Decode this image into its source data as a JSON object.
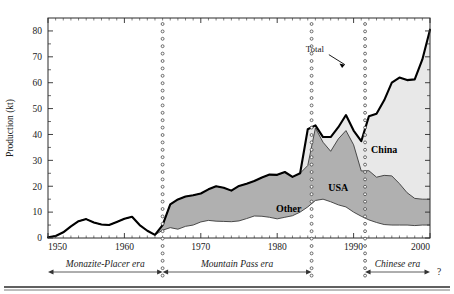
{
  "figure": {
    "y_axis_title": "Production (kt)",
    "bottom_rule": true
  },
  "chart_data": {
    "type": "area",
    "title": "",
    "xlabel": "",
    "ylabel": "Production (kt)",
    "xlim": [
      1950,
      2000
    ],
    "ylim": [
      0,
      85
    ],
    "yticks": [
      0,
      10,
      20,
      30,
      40,
      50,
      60,
      70,
      80
    ],
    "xticks": [
      1950,
      1960,
      1970,
      1980,
      1990,
      2000
    ],
    "xticklabels": [
      "1950",
      "1960",
      "1970",
      "1980",
      "1990",
      "2000"
    ],
    "yticklabels": [
      "0",
      "10",
      "20",
      "30",
      "40",
      "50",
      "60",
      "70",
      "80"
    ],
    "minor_ticks": true,
    "grid": false,
    "legend": "inline-annotations",
    "stacking": "cumulative",
    "annotations": [
      {
        "text": "Total",
        "x": 1986.5,
        "y": 72,
        "kind": "callout-with-arrow"
      },
      {
        "text": "China",
        "x": 1994.0,
        "y": 33,
        "kind": "area-label"
      },
      {
        "text": "USA",
        "x": 1988.0,
        "y": 18,
        "kind": "area-label"
      },
      {
        "text": "Other",
        "x": 1981.5,
        "y": 10,
        "kind": "area-label"
      }
    ],
    "dotted_dividers": [
      1965.0,
      1984.5,
      1991.5
    ],
    "x": [
      1950,
      1951,
      1952,
      1953,
      1954,
      1955,
      1956,
      1957,
      1958,
      1959,
      1960,
      1961,
      1962,
      1963,
      1964,
      1965,
      1966,
      1967,
      1968,
      1969,
      1970,
      1971,
      1972,
      1973,
      1974,
      1975,
      1976,
      1977,
      1978,
      1979,
      1980,
      1981,
      1982,
      1983,
      1984,
      1985,
      1986,
      1987,
      1988,
      1989,
      1990,
      1991,
      1992,
      1993,
      1994,
      1995,
      1996,
      1997,
      1998,
      1999,
      2000
    ],
    "series": [
      {
        "name": "Other",
        "fill": "#ffffff",
        "values": [
          0.3,
          0.8,
          2.2,
          4.5,
          6.5,
          7.3,
          6.0,
          5.2,
          5.0,
          6.2,
          7.4,
          8.2,
          5.0,
          2.8,
          1.2,
          3.0,
          4.0,
          3.4,
          4.5,
          5.0,
          6.2,
          6.8,
          6.5,
          6.4,
          6.3,
          6.6,
          7.5,
          8.5,
          8.4,
          8.0,
          7.4,
          8.0,
          8.6,
          10.0,
          12.0,
          14.5,
          15.0,
          14.0,
          12.8,
          12.0,
          10.0,
          8.4,
          7.0,
          6.0,
          5.2,
          5.0,
          5.0,
          5.0,
          4.8,
          5.0,
          5.0
        ]
      },
      {
        "name": "USA",
        "fill": "#b0b0b0",
        "values": [
          0.0,
          0.0,
          0.0,
          0.0,
          0.0,
          0.0,
          0.0,
          0.0,
          0.0,
          0.0,
          0.0,
          0.0,
          0.0,
          0.0,
          0.0,
          2.0,
          9.0,
          11.5,
          11.5,
          11.5,
          11.0,
          12.0,
          13.5,
          13.0,
          12.0,
          13.5,
          13.5,
          13.5,
          15.0,
          16.5,
          17.0,
          17.5,
          15.0,
          15.0,
          16.0,
          28.0,
          22.0,
          19.5,
          25.5,
          29.5,
          26.0,
          17.5,
          19.0,
          17.5,
          19.0,
          19.0,
          16.0,
          12.5,
          10.5,
          10.0,
          10.0
        ]
      },
      {
        "name": "China",
        "fill": "#e8e8e8",
        "values": [
          0.0,
          0.0,
          0.0,
          0.0,
          0.0,
          0.0,
          0.0,
          0.0,
          0.0,
          0.0,
          0.0,
          0.0,
          0.0,
          0.0,
          0.0,
          0.0,
          0.0,
          0.0,
          0.0,
          0.0,
          0.0,
          0.0,
          0.0,
          0.0,
          0.0,
          0.0,
          0.0,
          0.0,
          0.0,
          0.0,
          0.0,
          0.0,
          0.0,
          0.0,
          14.0,
          1.0,
          2.0,
          5.5,
          4.5,
          6.0,
          5.5,
          11.5,
          21.0,
          24.5,
          29.0,
          36.0,
          41.0,
          43.5,
          46.0,
          54.0,
          65.5
        ]
      }
    ],
    "total": {
      "name": "Total",
      "stroke": "#000000",
      "values": [
        0.3,
        0.8,
        2.2,
        4.5,
        6.5,
        7.3,
        6.0,
        5.2,
        5.0,
        6.2,
        7.4,
        8.2,
        5.0,
        2.8,
        1.2,
        5.0,
        13.0,
        14.9,
        16.0,
        16.5,
        17.2,
        18.8,
        20.0,
        19.4,
        18.3,
        20.1,
        21.0,
        22.0,
        23.4,
        24.5,
        24.4,
        25.5,
        23.6,
        25.0,
        42.0,
        43.5,
        39.0,
        39.0,
        42.8,
        47.5,
        41.5,
        37.4,
        47.0,
        48.0,
        53.2,
        60.0,
        62.0,
        61.0,
        61.3,
        69.0,
        80.5
      ]
    }
  },
  "eras": [
    {
      "name": "Monazite-Placer era",
      "start": 1950,
      "end": 1965,
      "arrows": "both"
    },
    {
      "name": "Mountain Pass era",
      "start": 1965,
      "end": 1984.5,
      "arrows": "both"
    },
    {
      "name": "Chinese era",
      "start": 1991.5,
      "end": 2000,
      "arrows": "both",
      "suffix": "?"
    }
  ]
}
